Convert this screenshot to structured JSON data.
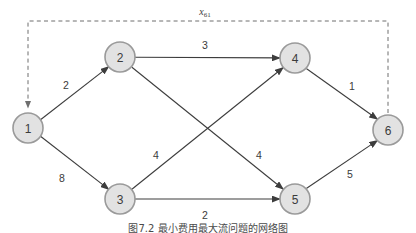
{
  "figure": {
    "type": "directed-network-graph",
    "caption": "图7.2 最小费用最大流问题的网络图",
    "background_color": "#ffffff"
  },
  "colors": {
    "node_fill": "#e2e2e2",
    "node_stroke": "#9a9a9a",
    "edge_stroke": "#3d3d3d",
    "flow_stroke": "#6f6f6f",
    "text": "#3b3b3b"
  },
  "nodes": [
    {
      "id": "1",
      "label": "1",
      "cx": 28,
      "cy": 128,
      "r": 15
    },
    {
      "id": "2",
      "label": "2",
      "cx": 120,
      "cy": 57,
      "r": 15
    },
    {
      "id": "3",
      "label": "3",
      "cx": 120,
      "cy": 199,
      "r": 15
    },
    {
      "id": "4",
      "label": "4",
      "cx": 295,
      "cy": 58,
      "r": 15
    },
    {
      "id": "5",
      "label": "5",
      "cx": 295,
      "cy": 199,
      "r": 15
    },
    {
      "id": "6",
      "label": "6",
      "cx": 388,
      "cy": 130,
      "r": 15
    }
  ],
  "edges": [
    {
      "id": "e12",
      "from": "1",
      "to": "2",
      "weight": "2",
      "label_x": 66,
      "label_y": 85
    },
    {
      "id": "e13",
      "from": "1",
      "to": "3",
      "weight": "8",
      "label_x": 62,
      "label_y": 178
    },
    {
      "id": "e24",
      "from": "2",
      "to": "4",
      "weight": "3",
      "label_x": 205,
      "label_y": 45
    },
    {
      "id": "e25",
      "from": "2",
      "to": "5",
      "weight": "4",
      "label_x": 156,
      "label_y": 155
    },
    {
      "id": "e34",
      "from": "3",
      "to": "4",
      "weight": "4",
      "label_x": 259,
      "label_y": 155
    },
    {
      "id": "e35",
      "from": "3",
      "to": "5",
      "weight": "2",
      "label_x": 205,
      "label_y": 215
    },
    {
      "id": "e46",
      "from": "4",
      "to": "6",
      "weight": "1",
      "label_x": 352,
      "label_y": 86
    },
    {
      "id": "e56",
      "from": "5",
      "to": "6",
      "weight": "5",
      "label_x": 350,
      "label_y": 174
    }
  ],
  "flow_arc": {
    "id": "x61",
    "from": "6",
    "to": "1",
    "label_main": "x",
    "label_sub": "61",
    "label_x": 205,
    "label_y": 12,
    "style": "dashed"
  }
}
